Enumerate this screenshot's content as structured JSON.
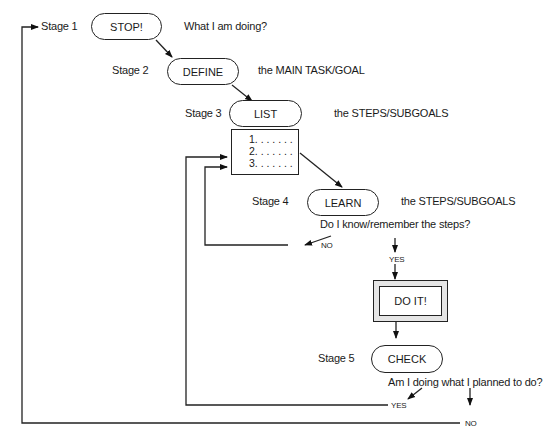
{
  "stages": [
    {
      "label": "Stage 1",
      "node": "STOP!",
      "note": "What I am doing?"
    },
    {
      "label": "Stage 2",
      "node": "DEFINE",
      "note": "the MAIN TASK/GOAL"
    },
    {
      "label": "Stage 3",
      "node": "LIST",
      "note": "the STEPS/SUBGOALS"
    },
    {
      "label": "Stage 4",
      "node": "LEARN",
      "note": "the STEPS/SUBGOALS"
    },
    {
      "label": "Stage 5",
      "node": "CHECK",
      "note": ""
    }
  ],
  "list_items": [
    "1. . . . . . .",
    "2. . . . . . .",
    "3. . . . . . ."
  ],
  "questions": {
    "learn": "Do I know/remember the steps?",
    "check": "Am I doing what I planned to do?"
  },
  "action": "DO IT!",
  "branches": {
    "learn_no": "NO",
    "learn_yes": "YES",
    "check_yes": "YES",
    "check_no": "NO"
  }
}
